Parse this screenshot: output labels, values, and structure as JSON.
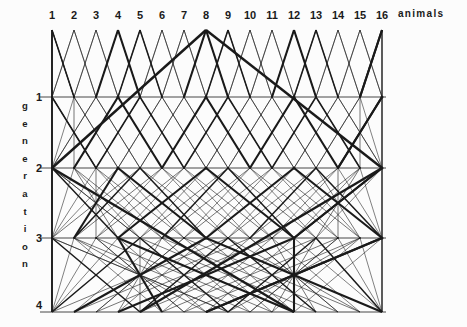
{
  "figure": {
    "type": "pedigree-lattice",
    "background_color": "#fcfcfc",
    "line_color": "#1a1a1a",
    "title": "",
    "x_axis": {
      "label": "animals",
      "label_x": 398,
      "label_y": 14,
      "ticks": [
        "1",
        "2",
        "3",
        "4",
        "5",
        "6",
        "7",
        "8",
        "9",
        "10",
        "11",
        "12",
        "13",
        "14",
        "15",
        "16"
      ],
      "tick_x": [
        52,
        74,
        96,
        118,
        140,
        162,
        184,
        206,
        228,
        250,
        272,
        294,
        316,
        338,
        360,
        382
      ],
      "tick_y": 15
    },
    "y_axis": {
      "label": "generation",
      "label_letters": [
        "g",
        "e",
        "n",
        "e",
        "r",
        "a",
        "t",
        "i",
        "o",
        "n"
      ],
      "ticks": [
        "1",
        "2",
        "3",
        "4"
      ],
      "tick_y": [
        97,
        168,
        238,
        305
      ],
      "tick_x": 40,
      "axis_x": 52,
      "axis_top": 30,
      "axis_bottom": 312
    },
    "geometry": {
      "n_animals": 16,
      "n_generations": 4,
      "col_spacing": 22,
      "x0": 52,
      "row_y": [
        30,
        97,
        168,
        238,
        312
      ],
      "spread_per_generation": [
        1,
        2,
        4,
        8
      ],
      "thin_width": 0.6,
      "thick_width": 2.1,
      "thick_every": 4
    }
  }
}
